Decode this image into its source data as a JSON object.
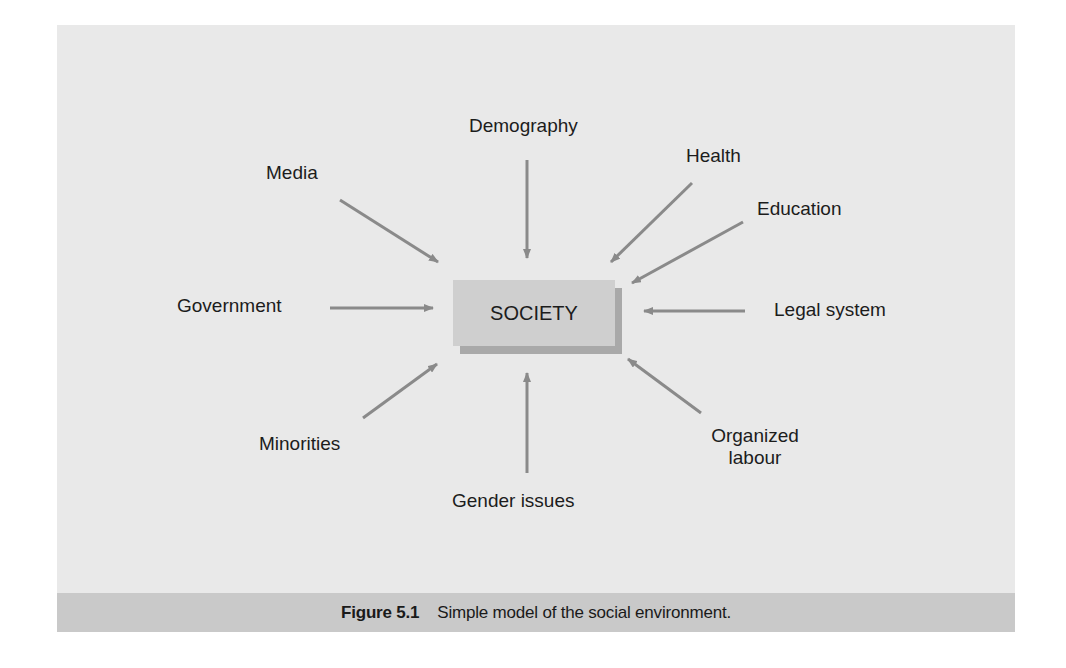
{
  "figure": {
    "center_node": "SOCIETY",
    "factors": {
      "demography": "Demography",
      "media": "Media",
      "health": "Health",
      "education": "Education",
      "government": "Government",
      "legal_system": "Legal system",
      "minorities": "Minorities",
      "organized_labour_line1": "Organized",
      "organized_labour_line2": "labour",
      "gender_issues": "Gender issues"
    },
    "caption": {
      "number": "Figure 5.1",
      "text": "Simple model of the social environment."
    },
    "colors": {
      "panel": "#e9e9e9",
      "caption_bar": "#c9c9c9",
      "box": "#cfcfcf",
      "box_shadow": "#a9a9a9",
      "arrow": "#8a8a8a"
    }
  }
}
